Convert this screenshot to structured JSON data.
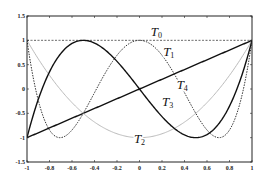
{
  "chart_data": {
    "type": "line",
    "title": "",
    "xlabel": "",
    "ylabel": "",
    "xlim": [
      -1,
      1
    ],
    "ylim": [
      -1.5,
      1.5
    ],
    "grid": false,
    "legend": "none (inline labels)",
    "x_ticks": [
      -1,
      -0.8,
      -0.6,
      -0.4,
      -0.2,
      0,
      0.2,
      0.4,
      0.6,
      0.8,
      1
    ],
    "x_tick_labels": [
      "-1",
      "-0.8",
      "-0.6",
      "-0.4",
      "-0.2",
      "0",
      "0.2",
      "0.4",
      "0.6",
      "0.8",
      "1"
    ],
    "y_ticks": [
      -1.5,
      -1,
      -0.5,
      0,
      0.5,
      1,
      1.5
    ],
    "y_tick_labels": [
      "-1.5",
      "-1",
      "-0.5",
      "0",
      "0.5",
      "1",
      "1.5"
    ],
    "series": [
      {
        "name": "T0",
        "label_main": "T",
        "label_sub": "0",
        "formula": "1",
        "style": "dashed",
        "color": "#333333",
        "label_at": [
          0.1,
          1.08
        ]
      },
      {
        "name": "T1",
        "label_main": "T",
        "label_sub": "1",
        "formula": "x",
        "style": "solid",
        "color": "#111111",
        "label_at": [
          0.21,
          0.68
        ]
      },
      {
        "name": "T2",
        "label_main": "T",
        "label_sub": "2",
        "formula": "2x^2-1",
        "style": "solid-light",
        "color": "#bbbbbb",
        "label_at": [
          -0.05,
          -1.1
        ]
      },
      {
        "name": "T3",
        "label_main": "T",
        "label_sub": "3",
        "formula": "4x^3-3x",
        "style": "solid",
        "color": "#111111",
        "label_at": [
          0.2,
          -0.35
        ]
      },
      {
        "name": "T4",
        "label_main": "T",
        "label_sub": "4",
        "formula": "8x^4-8x^2+1",
        "style": "dotted",
        "color": "#333333",
        "label_at": [
          0.33,
          -0.0
        ]
      }
    ]
  }
}
